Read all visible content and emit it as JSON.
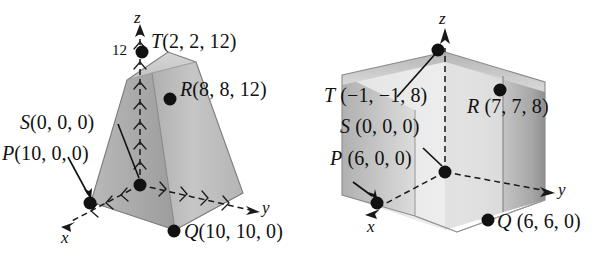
{
  "figures": [
    {
      "id": "left-frustum",
      "shape": "frustum-tapering-upward",
      "axes": {
        "x": "x",
        "y": "y",
        "z": "z"
      },
      "z_tick_label": "12",
      "points": [
        {
          "name": "T",
          "label_letter": "T",
          "label_coords": "(2, 2, 12)"
        },
        {
          "name": "R",
          "label_letter": "R",
          "label_coords": "(8, 8, 12)"
        },
        {
          "name": "S",
          "label_letter": "S",
          "label_coords": "(0, 0, 0)"
        },
        {
          "name": "P",
          "label_letter": "P",
          "label_coords": "(10, 0, 0)"
        },
        {
          "name": "Q",
          "label_letter": "Q",
          "label_coords": "(10, 10, 0)"
        }
      ]
    },
    {
      "id": "right-frustum",
      "shape": "frustum-flaring-upward",
      "axes": {
        "x": "x",
        "y": "y",
        "z": "z"
      },
      "z_tick_label": "",
      "points": [
        {
          "name": "T",
          "label_letter": "T",
          "label_coords": "(−1, −1, 8)"
        },
        {
          "name": "R",
          "label_letter": "R",
          "label_coords": "(7, 7, 8)"
        },
        {
          "name": "S",
          "label_letter": "S",
          "label_coords": "(0, 0, 0)"
        },
        {
          "name": "P",
          "label_letter": "P",
          "label_coords": "(6, 0, 0)"
        },
        {
          "name": "Q",
          "label_letter": "Q",
          "label_coords": "(6, 6, 0)"
        }
      ]
    }
  ],
  "colors": {
    "ink": "#111111",
    "face_left_dark": "#a8a8a8",
    "face_front_mid": "#bdbdbd",
    "face_top_light": "#cfcfcf",
    "face_right_dark": "#9a9a9a",
    "face_interior_light": "#e2e2e2",
    "outline": "#2b2b2b"
  }
}
